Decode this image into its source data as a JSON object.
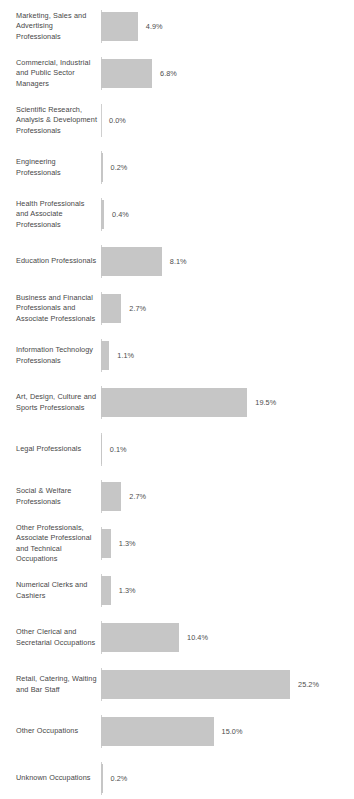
{
  "chart_data": {
    "type": "bar",
    "orientation": "horizontal",
    "title": "",
    "subtitle": "",
    "xlabel": "",
    "ylabel": "",
    "grid": false,
    "legend": null,
    "value_suffix": "%",
    "xlim": [
      0,
      25.2
    ],
    "px_per_unit": 7.5,
    "categories": [
      "Marketing, Sales and Advertising Professionals",
      "Commercial, Industrial and Public Sector Managers",
      "Scientific Research, Analysis & Development Professionals",
      "Engineering Professionals",
      "Health Professionals and Associate Professionals",
      "Education Professionals",
      "Business and Financial Professionals and Associate Professionals",
      "Information Technology Professionals",
      "Art, Design, Culture and Sports Professionals",
      "Legal Professionals",
      "Social & Welfare Professionals",
      "Other Professionals, Associate Professional and Technical Occupations",
      "Numerical Clerks and Cashiers",
      "Other Clerical and Secretarial Occupations",
      "Retail, Catering, Waiting and Bar Staff",
      "Other Occupations",
      "Unknown Occupations"
    ],
    "values": [
      4.9,
      6.8,
      0.0,
      0.2,
      0.4,
      8.1,
      2.7,
      1.1,
      19.5,
      0.1,
      2.7,
      1.3,
      1.3,
      10.4,
      25.2,
      15.0,
      0.2
    ],
    "value_labels": [
      "4.9%",
      "6.8%",
      "0.0%",
      "0.2%",
      "0.4%",
      "8.1%",
      "2.7%",
      "1.1%",
      "19.5%",
      "0.1%",
      "2.7%",
      "1.3%",
      "1.3%",
      "10.4%",
      "25.2%",
      "15.0%",
      "0.2%"
    ],
    "colors": {
      "bar_fill": "#c6c6c6",
      "axis_tick": "#cfcfcf",
      "label_text": "#474747",
      "value_text": "#4d4d4d",
      "background": "#ffffff"
    }
  },
  "rows": [
    {
      "label": "Marketing, Sales and Advertising Professionals",
      "value": 4.9,
      "value_label": "4.9%"
    },
    {
      "label": "Commercial, Industrial and Public Sector Managers",
      "value": 6.8,
      "value_label": "6.8%"
    },
    {
      "label": "Scientific Research, Analysis & Development Professionals",
      "value": 0.0,
      "value_label": "0.0%"
    },
    {
      "label": "Engineering Professionals",
      "value": 0.2,
      "value_label": "0.2%"
    },
    {
      "label": "Health Professionals and Associate Professionals",
      "value": 0.4,
      "value_label": "0.4%"
    },
    {
      "label": "Education Professionals",
      "value": 8.1,
      "value_label": "8.1%"
    },
    {
      "label": "Business and Financial Professionals and Associate Professionals",
      "value": 2.7,
      "value_label": "2.7%"
    },
    {
      "label": "Information Technology Professionals",
      "value": 1.1,
      "value_label": "1.1%"
    },
    {
      "label": "Art, Design, Culture and Sports Professionals",
      "value": 19.5,
      "value_label": "19.5%"
    },
    {
      "label": "Legal Professionals",
      "value": 0.1,
      "value_label": "0.1%"
    },
    {
      "label": "Social & Welfare Professionals",
      "value": 2.7,
      "value_label": "2.7%"
    },
    {
      "label": "Other Professionals, Associate Professional and Technical Occupations",
      "value": 1.3,
      "value_label": "1.3%"
    },
    {
      "label": "Numerical Clerks and Cashiers",
      "value": 1.3,
      "value_label": "1.3%"
    },
    {
      "label": "Other Clerical and Secretarial Occupations",
      "value": 10.4,
      "value_label": "10.4%"
    },
    {
      "label": "Retail, Catering, Waiting and Bar Staff",
      "value": 25.2,
      "value_label": "25.2%"
    },
    {
      "label": "Other Occupations",
      "value": 15.0,
      "value_label": "15.0%"
    },
    {
      "label": "Unknown Occupations",
      "value": 0.2,
      "value_label": "0.2%"
    }
  ]
}
